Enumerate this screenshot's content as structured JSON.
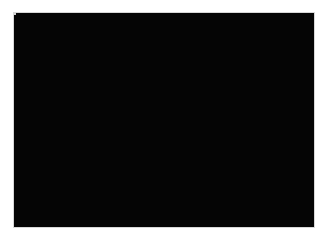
{
  "app": {
    "title": "Canvas Viewport",
    "canvas_background_color": "#000000",
    "frame_border_color": "#d8d8d8",
    "page_background_color": "#ffffff"
  },
  "canvas": {
    "x": 13,
    "y": 12,
    "width": 302,
    "height": 216,
    "label": "drawing-canvas"
  },
  "shapes": [
    {
      "id": "square-1",
      "label": "Square 1",
      "type": "rectangle",
      "selected": false,
      "fill_color": "#8a8a8a",
      "x": 77,
      "y": 34,
      "width": 75,
      "height": 78
    },
    {
      "id": "square-2",
      "label": "Square 2",
      "type": "rectangle",
      "selected": true,
      "fill_color": "#878787",
      "outline_color": "#9b9b9b",
      "handle_color": "#d5d5d5",
      "x": 148,
      "y": 110,
      "width": 77,
      "height": 78
    }
  ],
  "selection": {
    "active_shape": "Square 2",
    "handle_count": 8,
    "handles": [
      "top-left",
      "top-center",
      "top-right",
      "middle-left",
      "middle-right",
      "bottom-left",
      "bottom-center",
      "bottom-right"
    ]
  }
}
